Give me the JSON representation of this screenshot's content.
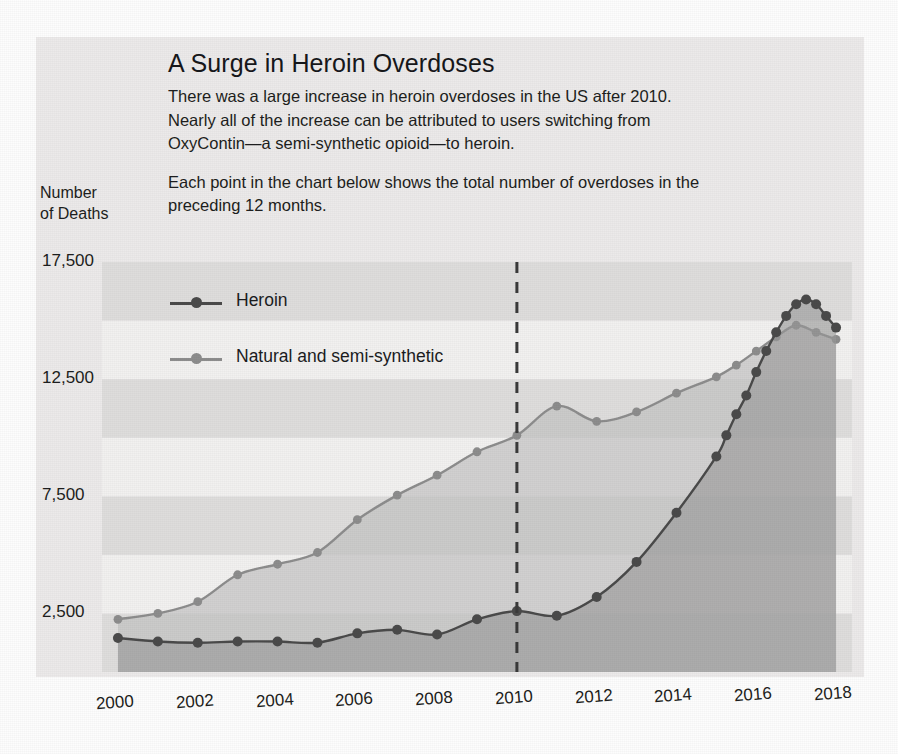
{
  "header": {
    "title": "A Surge in Heroin Overdoses",
    "paragraph1": "There was a large increase in heroin overdoses in the US after 2010. Nearly all of the increase can be attributed to users switching from OxyContin—a semi-synthetic opioid—to heroin.",
    "paragraph2": "Each point in the chart below shows the total number of overdoses in the preceding 12 months."
  },
  "axis": {
    "y_title_line1": "Number",
    "y_title_line2": "of Deaths"
  },
  "colors": {
    "heroin": "#4a4a4a",
    "natural": "#8d8d8d",
    "heroin_fill": "#9a9a9a",
    "natural_fill": "#c3c3c3",
    "panel": "#eceaea",
    "band_light": "#f2f1f0",
    "band_dark": "#dedddc",
    "axis_line": "#2a2a2a",
    "marker_2010_line": "#3a3a3a"
  },
  "annotations": {
    "marker_year": 2010
  },
  "chart_data": {
    "type": "line",
    "title": "A Surge in Heroin Overdoses",
    "subtitle": "Each point in the chart below shows the total number of overdoses in the preceding 12 months.",
    "xlabel": "",
    "ylabel": "Number of Deaths",
    "xlim": [
      1999.6,
      2018.4
    ],
    "ylim": [
      0,
      17500
    ],
    "yticks": [
      2500,
      7500,
      12500,
      17500
    ],
    "ytick_labels": [
      "2,500",
      "7,500",
      "12,500",
      "17,500"
    ],
    "xticks": [
      2000,
      2002,
      2004,
      2006,
      2008,
      2010,
      2012,
      2014,
      2016,
      2018
    ],
    "xtick_labels": [
      "2000",
      "2002",
      "2004",
      "2006",
      "2008",
      "2010",
      "2012",
      "2014",
      "2016",
      "2018"
    ],
    "grid": "horizontal-bands",
    "legend_position": "upper-left-inside",
    "annotation_vline_x": 2010,
    "series": [
      {
        "name": "Heroin",
        "color": "#4a4a4a",
        "filled": true,
        "x": [
          2000,
          2001,
          2002,
          2003,
          2004,
          2005,
          2006,
          2007,
          2008,
          2009,
          2010,
          2011,
          2012,
          2013,
          2014,
          2015.0,
          2015.25,
          2015.5,
          2015.75,
          2016.0,
          2016.25,
          2016.5,
          2016.75,
          2017.0,
          2017.25,
          2017.5,
          2017.75,
          2018.0
        ],
        "y": [
          1450,
          1300,
          1250,
          1300,
          1300,
          1250,
          1650,
          1800,
          1600,
          2250,
          2600,
          2400,
          3200,
          4700,
          6800,
          9200,
          10100,
          11000,
          11800,
          12800,
          13700,
          14500,
          15200,
          15700,
          15900,
          15700,
          15200,
          14700
        ]
      },
      {
        "name": "Natural and semi-synthetic",
        "color": "#8d8d8d",
        "filled": true,
        "x": [
          2000,
          2001,
          2002,
          2003,
          2004,
          2005,
          2006,
          2007,
          2008,
          2009,
          2010,
          2011,
          2012,
          2013,
          2014,
          2015.0,
          2015.5,
          2016.0,
          2016.5,
          2017.0,
          2017.5,
          2018.0
        ],
        "y": [
          2250,
          2500,
          3000,
          4150,
          4600,
          5100,
          6500,
          7550,
          8400,
          9400,
          10100,
          11350,
          10700,
          11100,
          11900,
          12600,
          13100,
          13700,
          14300,
          14800,
          14500,
          14200
        ]
      }
    ]
  }
}
